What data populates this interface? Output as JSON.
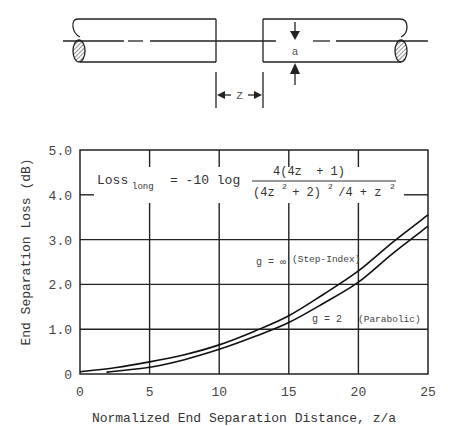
{
  "diagram": {
    "gap_label": "Z",
    "radius_label": "a"
  },
  "chart_data": {
    "type": "line",
    "title": "",
    "xlabel": "Normalized End Separation Distance, z/a",
    "ylabel": "End Separation Loss (dB)",
    "xlim": [
      0,
      25
    ],
    "ylim": [
      0,
      5.0
    ],
    "grid": true,
    "x_ticks": [
      0,
      5,
      10,
      15,
      20,
      25
    ],
    "x_tick_labels": [
      "0",
      "5",
      "10",
      "15",
      "20",
      "25"
    ],
    "y_ticks": [
      0,
      1.0,
      2.0,
      3.0,
      4.0,
      5.0
    ],
    "y_tick_labels": [
      "0",
      "1.0",
      "2.0",
      "3.0",
      "4.0",
      "5.0"
    ],
    "formula": {
      "lhs": "Loss",
      "lhs_sub": "long",
      "equals": "= -10 log",
      "numerator": "4(4z  + 1)",
      "denominator_parts": [
        "(4z",
        "2",
        " + 2)",
        "2",
        " /4 + z",
        "2"
      ]
    },
    "series": [
      {
        "name": "g = ∞ (Step-Index)",
        "label_left": "g = ∞",
        "label_right": "(Step-Index)",
        "x": [
          0,
          2.5,
          5,
          7.5,
          10,
          12.5,
          15,
          17.5,
          20,
          22.5,
          25
        ],
        "y": [
          0.05,
          0.14,
          0.27,
          0.43,
          0.65,
          0.95,
          1.3,
          1.78,
          2.3,
          2.95,
          3.55
        ]
      },
      {
        "name": "g = 2 (Parabolic)",
        "label_left": "g = 2",
        "label_right": "(Parabolic)",
        "x": [
          1.9,
          2.5,
          5,
          7.5,
          10,
          12.5,
          15,
          17.5,
          20,
          22.5,
          25
        ],
        "y": [
          0.04,
          0.06,
          0.15,
          0.32,
          0.55,
          0.83,
          1.15,
          1.58,
          2.05,
          2.7,
          3.3
        ]
      }
    ]
  }
}
